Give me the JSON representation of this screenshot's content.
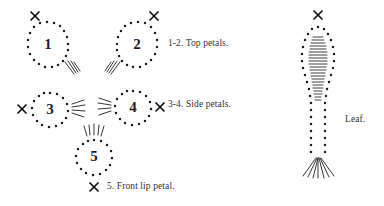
{
  "figure": {
    "background_color": "#ffffff",
    "ink_color": "#1f1f1f",
    "parts": [
      {
        "id": "petal-1",
        "number": "1",
        "shape": "teardrop",
        "orientation": "left",
        "center": [
          48,
          45
        ],
        "cross_mark": {
          "position": [
            35,
            15
          ],
          "label": "x"
        },
        "hatch_marks": {
          "position": [
            68,
            66
          ],
          "count": 4,
          "direction": "down-right"
        }
      },
      {
        "id": "petal-2",
        "number": "2",
        "shape": "teardrop",
        "orientation": "right",
        "center": [
          137,
          45
        ],
        "cross_mark": {
          "position": [
            152,
            15
          ],
          "label": "x"
        },
        "hatch_marks": {
          "position": [
            116,
            66
          ],
          "count": 4,
          "direction": "down-left"
        }
      },
      {
        "id": "petal-3",
        "number": "3",
        "shape": "circle",
        "orientation": "left",
        "center": [
          50,
          110
        ],
        "cross_mark": {
          "position": [
            25,
            110
          ],
          "label": "x"
        },
        "hatch_marks": {
          "position": [
            74,
            110
          ],
          "count": 4,
          "direction": "right"
        }
      },
      {
        "id": "petal-4",
        "number": "4",
        "shape": "circle",
        "orientation": "right",
        "center": [
          133,
          108
        ],
        "cross_mark": {
          "position": [
            158,
            108
          ],
          "label": "x"
        },
        "hatch_marks": {
          "position": [
            109,
            108
          ],
          "count": 4,
          "direction": "left"
        }
      },
      {
        "id": "petal-5",
        "number": "5",
        "shape": "circle",
        "orientation": "bottom",
        "center": [
          94,
          158
        ],
        "cross_mark": {
          "position": [
            94,
            187
          ],
          "label": "x"
        },
        "hatch_marks": {
          "position": [
            94,
            133
          ],
          "count": 5,
          "direction": "up"
        }
      },
      {
        "id": "leaf",
        "number": "",
        "shape": "elongated-leaf",
        "orientation": "upright",
        "center": [
          318,
          85
        ],
        "cross_mark": {
          "position": [
            318,
            15
          ],
          "label": "x"
        },
        "hatch_marks": {
          "position": [
            318,
            160
          ],
          "count": 7,
          "direction": "fan-down"
        },
        "veins": {
          "count": 22,
          "style": "horizontal-midrib"
        }
      }
    ],
    "captions": {
      "top_petals": "1-2. Top petals.",
      "side_petals": "3-4. Side petals.",
      "front_lip_petal": "5. Front lip petal.",
      "leaf": "Leaf."
    }
  }
}
